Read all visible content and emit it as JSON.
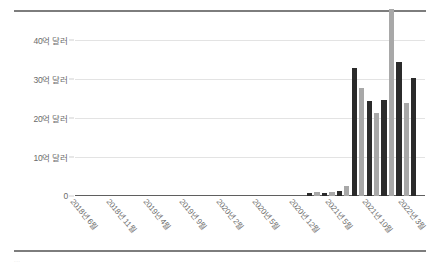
{
  "figure": {
    "background_color": "#ffffff",
    "border_color": "#7d7d7d",
    "footer_text": "..."
  },
  "chart_data": {
    "type": "bar",
    "title": "",
    "subtitle": "",
    "xlabel": "",
    "ylabel": "",
    "grid": true,
    "legend_position": "none",
    "ylim": [
      0,
      45
    ],
    "yticks": [
      0,
      10,
      20,
      30,
      40
    ],
    "ytick_labels": [
      "0",
      "10억 달러",
      "20억 달러",
      "30억 달러",
      "40억 달러"
    ],
    "unit_note": "억 달러",
    "xtick_labels": [
      "2018년 6월",
      "2018년 11월",
      "2019년 4월",
      "2019년 9월",
      "2020년 2월",
      "2020년 5월",
      "2020년 12월",
      "2021년 5월",
      "2021년 10월",
      "2022년 3월"
    ],
    "colors": {
      "bar_dark": "#2b2b2b",
      "bar_light": "#a8a8a8",
      "gridline": "#e3e3e3",
      "axis": "#5f5f5f",
      "text": "#6b6b6b"
    },
    "series": [
      {
        "name": "values",
        "values": [
          0,
          0,
          0,
          0,
          0,
          0,
          0,
          0,
          0,
          0,
          0,
          0,
          0,
          0,
          0,
          0,
          0,
          0,
          0,
          0,
          0,
          0,
          0,
          0,
          0.7,
          1.0,
          0.7,
          1.1,
          1.4,
          2.6,
          32.8,
          27.7,
          24.3,
          21.3,
          24.6,
          47.7,
          34.2,
          23.9,
          30.3
        ]
      }
    ],
    "bars": [
      {
        "index": 0,
        "value": 0.7,
        "color": "dark"
      },
      {
        "index": 1,
        "value": 1.0,
        "color": "light"
      },
      {
        "index": 2,
        "value": 0.7,
        "color": "dark"
      },
      {
        "index": 3,
        "value": 1.1,
        "color": "light"
      },
      {
        "index": 4,
        "value": 1.4,
        "color": "dark"
      },
      {
        "index": 5,
        "value": 2.6,
        "color": "light"
      },
      {
        "index": 6,
        "value": 32.8,
        "color": "dark"
      },
      {
        "index": 7,
        "value": 27.7,
        "color": "light"
      },
      {
        "index": 8,
        "value": 24.3,
        "color": "dark"
      },
      {
        "index": 9,
        "value": 21.3,
        "color": "light"
      },
      {
        "index": 10,
        "value": 24.6,
        "color": "dark"
      },
      {
        "index": 11,
        "value": 47.7,
        "color": "light"
      },
      {
        "index": 12,
        "value": 34.2,
        "color": "dark"
      },
      {
        "index": 13,
        "value": 23.9,
        "color": "light"
      },
      {
        "index": 14,
        "value": 30.3,
        "color": "dark"
      }
    ]
  }
}
